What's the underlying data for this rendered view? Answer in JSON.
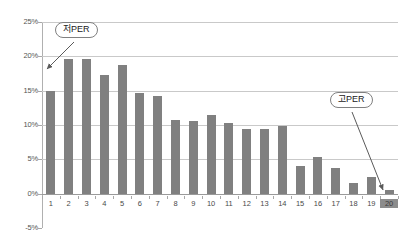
{
  "chart_data": {
    "type": "bar",
    "title": "",
    "xlabel": "",
    "ylabel": "",
    "categories": [
      "1",
      "2",
      "3",
      "4",
      "5",
      "6",
      "7",
      "8",
      "9",
      "10",
      "11",
      "12",
      "13",
      "14",
      "15",
      "16",
      "17",
      "18",
      "19",
      "20"
    ],
    "values": [
      15.0,
      19.6,
      19.6,
      17.3,
      18.8,
      14.7,
      14.2,
      10.8,
      10.6,
      11.5,
      10.3,
      9.4,
      9.4,
      9.8,
      4.1,
      5.3,
      3.8,
      1.5,
      2.5,
      0.5
    ],
    "ylim": [
      -5,
      25
    ],
    "ytick_labels": [
      "25%",
      "20%",
      "15%",
      "10%",
      "5%",
      "0%",
      "-5%"
    ],
    "ytick_values": [
      25,
      20,
      15,
      10,
      5,
      0,
      -5
    ],
    "grid": true,
    "legend": "none",
    "series_color": "#808080",
    "annotations": [
      {
        "id": "low-per",
        "text": "저PER",
        "points_to_category": "1"
      },
      {
        "id": "high-per",
        "text": "고PER",
        "points_to_category": "20"
      }
    ],
    "highlighted_category": "20"
  },
  "colors": {
    "bar": "#808080",
    "gridline": "#c9c9c9",
    "zero_line": "#9a9a9a",
    "axis": "#b0b0b0",
    "tick_text": "#555555",
    "callout_border": "#808080",
    "callout_text": "#222222",
    "highlight": "#8c8c8c",
    "background": "#ffffff"
  }
}
